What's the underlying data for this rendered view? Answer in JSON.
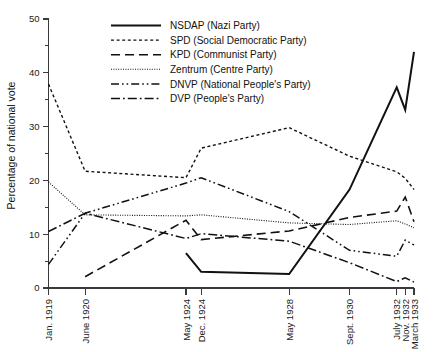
{
  "chart_data": {
    "type": "line",
    "title": "",
    "subtitle": "",
    "xlabel": "",
    "ylabel": "Percentage of national vote",
    "ylim": [
      0,
      50
    ],
    "ytick_step": 10,
    "yminor_step": 5,
    "ytick_labels": [
      "0",
      "10",
      "20",
      "30",
      "40",
      "50"
    ],
    "grid": false,
    "legend_position": "top-center",
    "categories": [
      "Jan. 1919",
      "June 1920",
      "May 1924",
      "Dec. 1924",
      "May 1928",
      "Sept. 1930",
      "July 1932",
      "Nov. 1932",
      "March 1933"
    ],
    "x_positions": [
      0,
      1.42,
      5.33,
      5.92,
      9.33,
      11.67,
      13.5,
      13.83,
      14.17
    ],
    "x_axis_note": "time-proportional spacing, years from Jan. 1919",
    "series": [
      {
        "name": "NSDAP (Nazi Party)",
        "legend_label": "NSDAP (Nazi Party)",
        "dash": "solid",
        "stroke_width": 2.0,
        "dasharray": "none",
        "values": [
          null,
          null,
          6.5,
          3.0,
          2.6,
          18.3,
          37.3,
          33.1,
          43.9
        ]
      },
      {
        "name": "SPD (Social Democratic Party)",
        "legend_label": "SPD (Social Democratic Party)",
        "dash": "dotted-short",
        "stroke_width": 1.4,
        "dasharray": "3,2.6",
        "values": [
          37.9,
          21.7,
          20.5,
          26.0,
          29.8,
          24.5,
          21.6,
          20.4,
          18.3
        ]
      },
      {
        "name": "KPD (Communist Party)",
        "legend_label": "KPD (Communist Party)",
        "dash": "dashed-long",
        "stroke_width": 1.6,
        "dasharray": "9,5",
        "values": [
          null,
          2.1,
          12.6,
          9.0,
          10.6,
          13.1,
          14.3,
          16.9,
          12.3
        ]
      },
      {
        "name": "Zentrum (Centre Party)",
        "legend_label": "Zentrum (Centre Party)",
        "dash": "dotted-fine",
        "stroke_width": 1.1,
        "dasharray": "1,1.4",
        "values": [
          19.7,
          13.6,
          13.4,
          13.6,
          12.1,
          11.8,
          12.5,
          11.9,
          11.2
        ]
      },
      {
        "name": "DNVP (National People's Party)",
        "legend_label": "DNVP (National People's Party)",
        "dash": "dash-dot-dot",
        "stroke_width": 1.5,
        "dasharray": "8,3,1.6,3,1.6,3",
        "values": [
          4.4,
          13.9,
          19.5,
          20.5,
          14.2,
          7.0,
          5.9,
          8.9,
          8.0
        ]
      },
      {
        "name": "DVP (People's Party)",
        "legend_label": "DVP (People's Party)",
        "dash": "dash-dot",
        "stroke_width": 1.5,
        "dasharray": "9,3,1.8,3",
        "values": [
          10.5,
          13.9,
          9.2,
          10.1,
          8.7,
          4.7,
          1.2,
          1.9,
          1.1
        ]
      }
    ]
  },
  "legend": {
    "items": [
      {
        "label": "NSDAP (Nazi Party)"
      },
      {
        "label": "SPD (Social Democratic Party)"
      },
      {
        "label": "KPD (Communist Party)"
      },
      {
        "label": "Zentrum (Centre Party)"
      },
      {
        "label": "DNVP (National People's Party)"
      },
      {
        "label": "DVP (People's Party)"
      }
    ]
  },
  "colors": {
    "ink": "#111111",
    "axis": "#3a3a3a",
    "background": "#ffffff"
  }
}
